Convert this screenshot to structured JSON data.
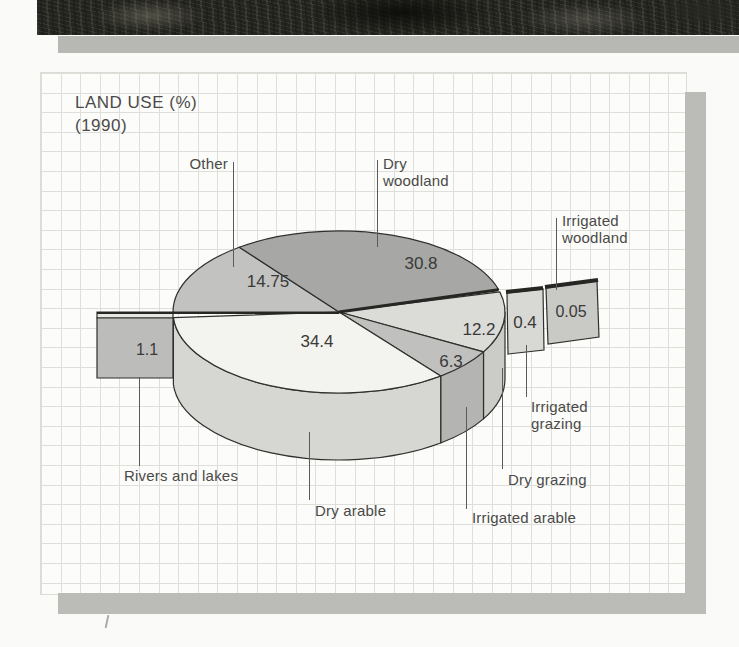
{
  "labels": {
    "title_line1": "LAND USE (%)",
    "title_line2": "(1990)"
  },
  "chart_data": {
    "type": "pie",
    "style": "3d-exploded",
    "title": "LAND USE (%)",
    "subtitle": "(1990)",
    "unit": "percent",
    "start_angle_deg": 180,
    "direction": "clockwise",
    "series": [
      {
        "name": "Other",
        "value": 14.75,
        "label": "14.75",
        "color": "#c2c2c0",
        "exploded": false
      },
      {
        "name": "Dry woodland",
        "value": 30.8,
        "label": "30.8",
        "color": "#a7a7a5",
        "exploded": false
      },
      {
        "name": "Irrigated woodland",
        "value": 0.05,
        "label": "0.05",
        "color": "#c9c9c6",
        "exploded": true
      },
      {
        "name": "Irrigated grazing",
        "value": 0.4,
        "label": "0.4",
        "color": "#d8d8d5",
        "exploded": true
      },
      {
        "name": "Dry grazing",
        "value": 12.2,
        "label": "12.2",
        "color": "#dbdbd8",
        "exploded": false,
        "side_color": "#cbcbc8"
      },
      {
        "name": "Irrigated arable",
        "value": 6.3,
        "label": "6.3",
        "color": "#c0c0be",
        "exploded": false,
        "side_color": "#b4b4b2"
      },
      {
        "name": "Dry arable",
        "value": 34.4,
        "label": "34.4",
        "color": "#f3f3ef",
        "exploded": false,
        "side_color": "#d6d6d2"
      },
      {
        "name": "Rivers and lakes",
        "value": 1.1,
        "label": "1.1",
        "color": "#bcbcba",
        "exploded": true
      }
    ]
  }
}
